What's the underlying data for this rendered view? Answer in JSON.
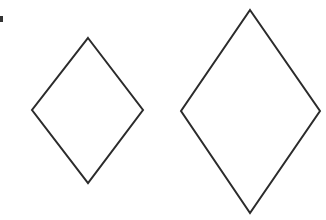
{
  "canvas": {
    "width": 326,
    "height": 220,
    "background": "#ffffff"
  },
  "stroke": {
    "color": "#2b2b2b",
    "width": 2
  },
  "shapes": [
    {
      "type": "rhombus",
      "name": "small-diamond",
      "points": "88,38 143,110 88,183 32,110"
    },
    {
      "type": "rhombus",
      "name": "large-diamond",
      "points": "250,10 320,111 250,213 181,111"
    }
  ],
  "edge_mark": {
    "color": "#333333"
  }
}
